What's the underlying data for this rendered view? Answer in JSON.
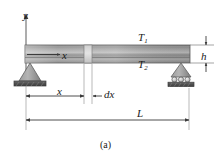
{
  "figure": {
    "caption": "(a)",
    "kind": "simply-supported-beam-diagram",
    "labels": {
      "y_axis": "y",
      "x_inside_beam": "x",
      "temperature_top": "T",
      "temperature_top_subscript": "1",
      "temperature_bottom": "T",
      "temperature_bottom_subscript": "2",
      "beam_height": "h",
      "x_dimension": "x",
      "element_width": "dx",
      "span_length": "L"
    },
    "colors": {
      "beam_dark": "#6f6f6f",
      "beam_mid": "#9a9a9a",
      "beam_light": "#c9c9c9",
      "element_highlight": "#d8d8d8",
      "support_fill": "#8d8d8d",
      "support_base": "#5a5a5a",
      "line": "#3a3a3a",
      "background": "#ffffff",
      "text": "#1a1a1a"
    },
    "geometry": {
      "beam_left_px": 25,
      "beam_right_px": 190,
      "beam_top_px": 45,
      "beam_bottom_px": 63,
      "element_left_px": 84,
      "element_right_px": 92,
      "x_dim_y_px": 96,
      "span_dim_y_px": 120
    },
    "supports": {
      "left": "pin-support",
      "right": "roller-support",
      "roller_count": 3
    }
  }
}
